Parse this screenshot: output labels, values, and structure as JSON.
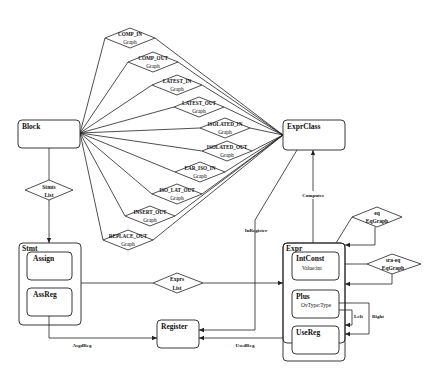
{
  "diagram": {
    "entities": {
      "block": {
        "label": "Block"
      },
      "expr_class": {
        "label": "ExprClass"
      },
      "stmt": {
        "label": "Stmt",
        "children": [
          {
            "label": "Assign"
          },
          {
            "label": "AssReg"
          }
        ]
      },
      "expr": {
        "label": "Expr",
        "children": [
          {
            "label": "IntConst",
            "attr": "Value:int"
          },
          {
            "label": "Plus",
            "attr": "OvType:Type"
          },
          {
            "label": "UseReg"
          }
        ]
      },
      "register": {
        "label": "Register"
      }
    },
    "relationships": {
      "graphs": [
        {
          "name": "COMP_IN",
          "type": "Graph"
        },
        {
          "name": "COMP_OUT",
          "type": "Graph"
        },
        {
          "name": "LATEST_IN",
          "type": "Graph"
        },
        {
          "name": "LATEST_OUT",
          "type": "Graph"
        },
        {
          "name": "ISOLATED_IN",
          "type": "Graph"
        },
        {
          "name": "ISOLATED_OUT",
          "type": "Graph"
        },
        {
          "name": "EAR_ISO_IN",
          "type": "Graph"
        },
        {
          "name": "ISO_LAT_OUT",
          "type": "Graph"
        },
        {
          "name": "INSERT_OUT",
          "type": "Graph"
        },
        {
          "name": "REPLACE_OUT",
          "type": "Graph"
        }
      ],
      "stmts_list": {
        "line1": "Stmts",
        "line2": "List"
      },
      "exprs_list": {
        "line1": "Exprs",
        "line2": "List"
      },
      "eq": {
        "line1": "eq",
        "line2": "EqGraph"
      },
      "sra_eq": {
        "line1": "sra-eq",
        "line2": "EqGraph"
      }
    },
    "edge_labels": {
      "in_register": "InRegister",
      "computes": "Computes",
      "assgd_reg": "AsgdReg",
      "used_reg": "UsedReg",
      "left": "Left",
      "right": "Right"
    }
  }
}
